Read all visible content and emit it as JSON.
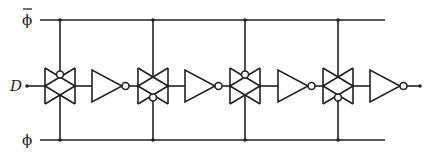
{
  "diagram": {
    "type": "circuit-schematic",
    "labels": {
      "top_clock": "ϕ",
      "top_clock_overbar": true,
      "bottom_clock": "ϕ",
      "input": "D"
    },
    "colors": {
      "line": "#222222",
      "background": "#ffffff"
    },
    "rails": {
      "top": {
        "name": "phi-bar",
        "y": 20,
        "x_start": 40,
        "x_end": 385
      },
      "bottom": {
        "name": "phi",
        "y": 140,
        "x_start": 40,
        "x_end": 385
      }
    },
    "signal_y": 86,
    "stages": [
      {
        "tg_x": 45,
        "bubble": "top",
        "inv_x": 92
      },
      {
        "tg_x": 138,
        "bubble": "bottom",
        "inv_x": 185
      },
      {
        "tg_x": 230,
        "bubble": "top",
        "inv_x": 278
      },
      {
        "tg_x": 323,
        "bubble": "bottom",
        "inv_x": 370
      }
    ],
    "output_dot_x": 420
  }
}
